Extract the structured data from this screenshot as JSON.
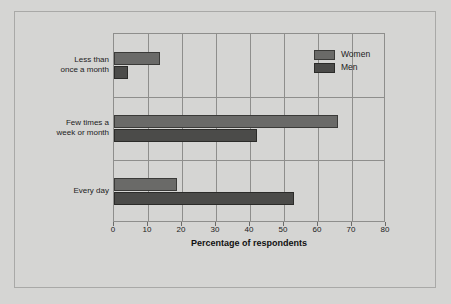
{
  "chart_data": {
    "type": "bar",
    "orientation": "horizontal",
    "title": "",
    "xlabel": "Percentage of respondents",
    "ylabel": "How often people think about sex",
    "categories": [
      "Less than\nonce a month",
      "Few times a\nweek or month",
      "Every day"
    ],
    "category_lines": [
      [
        "Less than",
        "once a month"
      ],
      [
        "Few times a",
        "week or month"
      ],
      [
        "Every day"
      ]
    ],
    "series": [
      {
        "name": "Women",
        "color": "#6a6a68",
        "values": [
          13.5,
          66,
          18.5
        ]
      },
      {
        "name": "Men",
        "color": "#4b4b49",
        "values": [
          4,
          42,
          53
        ]
      }
    ],
    "xlim": [
      0,
      80
    ],
    "xticks": [
      0,
      10,
      20,
      30,
      40,
      50,
      60,
      70,
      80
    ],
    "xtick_labels": [
      "0",
      "10",
      "20",
      "30",
      "40",
      "50",
      "60",
      "70",
      "80"
    ],
    "grid": "vertical",
    "legend_position": "top-right"
  },
  "legend": {
    "items": [
      {
        "label": "Women"
      },
      {
        "label": "Men"
      }
    ]
  },
  "axes": {
    "x_title": "Percentage of respondents",
    "y_title": "How often people think about sex"
  }
}
